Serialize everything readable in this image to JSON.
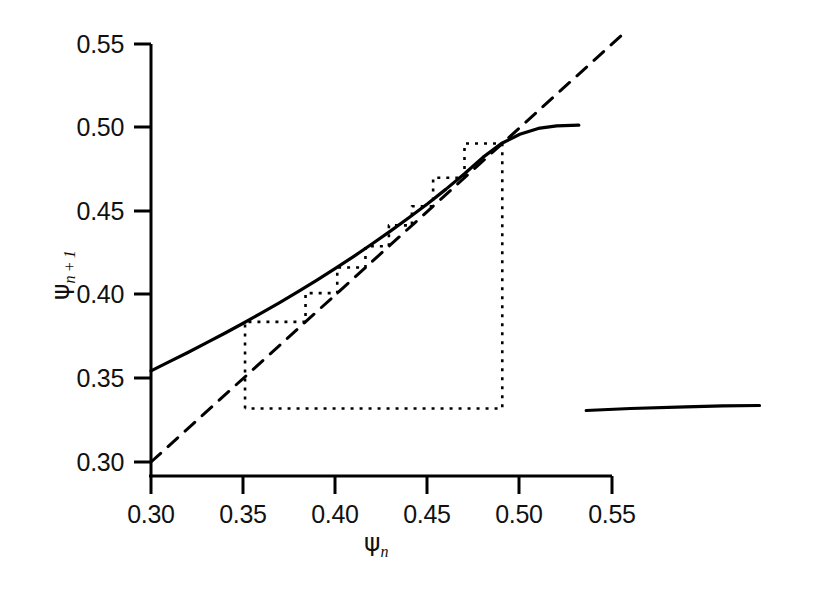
{
  "figure": {
    "background": "#ffffff",
    "line_color": "#000000",
    "width": 823,
    "height": 589
  },
  "axes": {
    "x_title_psi": "ψ",
    "x_title_sub": "n",
    "y_title_psi": "ψ",
    "y_title_sub": "n + 1",
    "x_ticks": [
      "0.30",
      "0.35",
      "0.40",
      "0.45",
      "0.50",
      "0.55"
    ],
    "y_ticks": [
      "0.55",
      "0.50",
      "0.45",
      "0.40",
      "0.35",
      "0.30"
    ]
  },
  "chart_data": {
    "type": "line",
    "title": "",
    "subtitle": "",
    "xlabel": "ψ_n",
    "ylabel": "ψ_{n+1}",
    "xlim": [
      0.3,
      0.55
    ],
    "ylim": [
      0.3,
      0.55
    ],
    "xticks": [
      0.3,
      0.35,
      0.4,
      0.45,
      0.5,
      0.55
    ],
    "yticks": [
      0.3,
      0.35,
      0.4,
      0.45,
      0.5,
      0.55
    ],
    "grid": false,
    "legend": "none",
    "series": [
      {
        "name": "map-upper-branch",
        "style": "solid",
        "description": "Main return map branch psi_{n+1} = f(psi_n), rising and slightly concave, ending abruptly at the critical point.",
        "points": [
          [
            0.3,
            0.3545
          ],
          [
            0.31,
            0.36
          ],
          [
            0.32,
            0.3655
          ],
          [
            0.33,
            0.3712
          ],
          [
            0.34,
            0.377
          ],
          [
            0.35,
            0.383
          ],
          [
            0.36,
            0.3892
          ],
          [
            0.37,
            0.3955
          ],
          [
            0.38,
            0.402
          ],
          [
            0.39,
            0.4088
          ],
          [
            0.4,
            0.4158
          ],
          [
            0.41,
            0.423
          ],
          [
            0.42,
            0.4305
          ],
          [
            0.43,
            0.4382
          ],
          [
            0.44,
            0.4462
          ],
          [
            0.45,
            0.4545
          ],
          [
            0.46,
            0.4632
          ],
          [
            0.47,
            0.4724
          ],
          [
            0.48,
            0.4822
          ],
          [
            0.49,
            0.4905
          ],
          [
            0.5,
            0.496
          ],
          [
            0.51,
            0.4995
          ],
          [
            0.52,
            0.501
          ],
          [
            0.532,
            0.5015
          ]
        ]
      },
      {
        "name": "map-lower-branch",
        "style": "solid",
        "description": "Lower (reinjection) branch of the map appearing after the critical point, nearly flat near psi ~ 0.333.",
        "points": [
          [
            0.536,
            0.3308
          ],
          [
            0.56,
            0.332
          ],
          [
            0.59,
            0.333
          ],
          [
            0.61,
            0.3336
          ],
          [
            0.63,
            0.3338
          ]
        ]
      },
      {
        "name": "identity-line",
        "style": "dashed",
        "description": "Diagonal psi_{n+1} = psi_n reference line.",
        "points": [
          [
            0.3,
            0.3
          ],
          [
            0.555,
            0.555
          ]
        ]
      },
      {
        "name": "cobweb-trajectory",
        "style": "dotted",
        "description": "Cobweb iteration staircase: vertical to the map, horizontal to the diagonal, repeated; ends with a long drop to the lower branch and a long horizontal reinjection.",
        "points": [
          [
            0.351,
            0.332
          ],
          [
            0.351,
            0.3838
          ],
          [
            0.3838,
            0.3838
          ],
          [
            0.3838,
            0.401
          ],
          [
            0.401,
            0.401
          ],
          [
            0.401,
            0.4163
          ],
          [
            0.4163,
            0.4163
          ],
          [
            0.4163,
            0.429
          ],
          [
            0.429,
            0.429
          ],
          [
            0.429,
            0.4415
          ],
          [
            0.4415,
            0.4415
          ],
          [
            0.4415,
            0.453
          ],
          [
            0.453,
            0.453
          ],
          [
            0.453,
            0.47
          ],
          [
            0.47,
            0.47
          ],
          [
            0.47,
            0.4905
          ],
          [
            0.4905,
            0.4905
          ],
          [
            0.4905,
            0.332
          ],
          [
            0.351,
            0.332
          ]
        ]
      }
    ],
    "annotations": [
      {
        "text": "",
        "note": "Cobweb ladder of 8 steps climbing the upper branch, then a vertical drop from psi~0.49 down to the lower branch at psi_{n+1}~0.332 and a horizontal reinjection back to psi~0.351."
      }
    ]
  }
}
